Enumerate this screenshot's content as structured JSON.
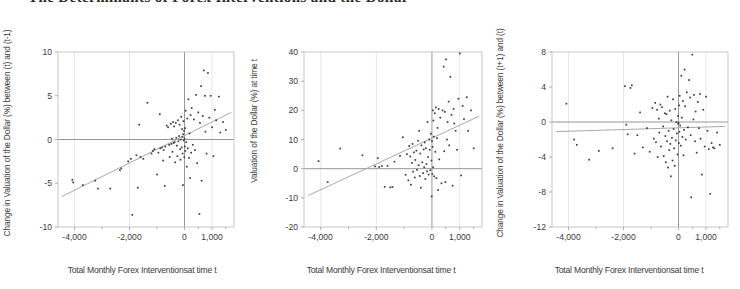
{
  "figure": {
    "title_clipped": "The Determinants of Forex Interventions and the Dollar",
    "background": "#ffffff",
    "point_color": "#3d3d3d",
    "trend_color": "#a8a8a8",
    "frame_color": "#b9b9b9"
  },
  "chart_data": [
    {
      "type": "scatter",
      "title": "",
      "xlabel": "Total Monthly Forex Interventionsat time t",
      "ylabel": "Change in Valuation of the Dollar (%) between (t) and (t-1)",
      "xlim": [
        -4600,
        1800
      ],
      "ylim": [
        -10,
        10
      ],
      "xticks": [
        -4000,
        -2000,
        0,
        1000
      ],
      "xticklabels": [
        "-4,000",
        "-2,000",
        "0",
        "1,000"
      ],
      "yticks": [
        -10,
        -5,
        0,
        5,
        10
      ],
      "yticklabels": [
        "-10",
        "-5",
        "0",
        "5",
        "10"
      ],
      "grid": true,
      "legend": "none",
      "trendline": {
        "x": [
          -4450,
          1700
        ],
        "y": [
          -6.5,
          3.1
        ]
      },
      "points": [
        [
          -4080,
          -4.6
        ],
        [
          -4050,
          -4.9
        ],
        [
          -3700,
          -5.2
        ],
        [
          -3250,
          -4.7
        ],
        [
          -3150,
          -5.6
        ],
        [
          -2700,
          -5.6
        ],
        [
          -2350,
          -3.5
        ],
        [
          -2300,
          -3.3
        ],
        [
          -2050,
          -2.5
        ],
        [
          -1950,
          -2.2
        ],
        [
          -1900,
          -8.6
        ],
        [
          -1750,
          -1.8
        ],
        [
          -1700,
          -5.5
        ],
        [
          -1650,
          1.7
        ],
        [
          -1600,
          -2.0
        ],
        [
          -1500,
          -2.2
        ],
        [
          -1350,
          4.2
        ],
        [
          -1200,
          -1.6
        ],
        [
          -1150,
          -1.3
        ],
        [
          -1100,
          -1.1
        ],
        [
          -1000,
          -4.0
        ],
        [
          -950,
          -1.5
        ],
        [
          -900,
          2.9
        ],
        [
          -880,
          -1.0
        ],
        [
          -820,
          -0.9
        ],
        [
          -780,
          -2.4
        ],
        [
          -760,
          -1.2
        ],
        [
          -720,
          -5.3
        ],
        [
          -700,
          -0.8
        ],
        [
          -650,
          1.6
        ],
        [
          -600,
          1.4
        ],
        [
          -560,
          -0.6
        ],
        [
          -540,
          -2.0
        ],
        [
          -500,
          1.8
        ],
        [
          -480,
          -0.5
        ],
        [
          -460,
          0.1
        ],
        [
          -440,
          -1.4
        ],
        [
          -420,
          2.0
        ],
        [
          -400,
          -0.4
        ],
        [
          -380,
          1.5
        ],
        [
          -360,
          -0.3
        ],
        [
          -340,
          -2.6
        ],
        [
          -320,
          1.9
        ],
        [
          -300,
          0.2
        ],
        [
          -280,
          -0.7
        ],
        [
          -260,
          -1.9
        ],
        [
          -240,
          2.2
        ],
        [
          -220,
          -0.2
        ],
        [
          -200,
          0.4
        ],
        [
          -180,
          1.7
        ],
        [
          -160,
          -1.1
        ],
        [
          -150,
          -2.3
        ],
        [
          -140,
          0.0
        ],
        [
          -120,
          2.6
        ],
        [
          -100,
          -0.9
        ],
        [
          -90,
          1.2
        ],
        [
          -80,
          0.3
        ],
        [
          -70,
          -1.6
        ],
        [
          -60,
          -5.2
        ],
        [
          -50,
          0.6
        ],
        [
          -40,
          2.1
        ],
        [
          -30,
          -0.1
        ],
        [
          -20,
          1.0
        ],
        [
          -10,
          -2.0
        ],
        [
          0,
          0.1
        ],
        [
          10,
          -0.8
        ],
        [
          20,
          1.3
        ],
        [
          30,
          -1.3
        ],
        [
          40,
          3.3
        ],
        [
          60,
          -0.3
        ],
        [
          80,
          -3.1
        ],
        [
          100,
          2.4
        ],
        [
          120,
          -1.0
        ],
        [
          140,
          4.6
        ],
        [
          160,
          -2.1
        ],
        [
          180,
          0.7
        ],
        [
          200,
          -4.4
        ],
        [
          220,
          2.8
        ],
        [
          240,
          -1.5
        ],
        [
          260,
          3.6
        ],
        [
          300,
          -0.6
        ],
        [
          340,
          2.3
        ],
        [
          380,
          -1.2
        ],
        [
          420,
          5.1
        ],
        [
          460,
          -2.7
        ],
        [
          500,
          3.1
        ],
        [
          540,
          -8.5
        ],
        [
          560,
          1.9
        ],
        [
          600,
          6.1
        ],
        [
          620,
          -4.7
        ],
        [
          660,
          2.7
        ],
        [
          700,
          7.9
        ],
        [
          740,
          5.0
        ],
        [
          760,
          0.9
        ],
        [
          800,
          -1.6
        ],
        [
          850,
          7.6
        ],
        [
          900,
          2.5
        ],
        [
          950,
          5.0
        ],
        [
          1000,
          1.4
        ],
        [
          1050,
          -1.9
        ],
        [
          1100,
          3.4
        ],
        [
          1150,
          2.2
        ],
        [
          1250,
          4.9
        ],
        [
          1300,
          0.8
        ],
        [
          1400,
          2.0
        ],
        [
          1500,
          1.1
        ]
      ]
    },
    {
      "type": "scatter",
      "title": "",
      "xlabel": "Total Monthly Forex Interventionsat time t",
      "ylabel": "Valuation of the Dollar (%) at time t",
      "xlim": [
        -4600,
        1800
      ],
      "ylim": [
        -20,
        40
      ],
      "xticks": [
        -4000,
        -2000,
        0,
        1000
      ],
      "xticklabels": [
        "-4,000",
        "-2,000",
        "0",
        "1,000"
      ],
      "yticks": [
        -20,
        -10,
        0,
        10,
        20,
        30,
        40
      ],
      "yticklabels": [
        "-20",
        "-10",
        "0",
        "10",
        "20",
        "30",
        "40"
      ],
      "grid": true,
      "legend": "none",
      "trendline": {
        "x": [
          -4450,
          1700
        ],
        "y": [
          -9.2,
          18.0
        ]
      },
      "points": [
        [
          -4080,
          2.6
        ],
        [
          -3750,
          -4.6
        ],
        [
          -3300,
          6.9
        ],
        [
          -2500,
          4.6
        ],
        [
          -2050,
          0.8
        ],
        [
          -1950,
          3.6
        ],
        [
          -1900,
          0.6
        ],
        [
          -1800,
          0.9
        ],
        [
          -1700,
          -6.2
        ],
        [
          -1600,
          1.0
        ],
        [
          -1500,
          -6.4
        ],
        [
          -1420,
          -6.3
        ],
        [
          -1350,
          2.4
        ],
        [
          -1150,
          4.4
        ],
        [
          -1050,
          10.8
        ],
        [
          -950,
          -2.1
        ],
        [
          -900,
          5.0
        ],
        [
          -850,
          -4.0
        ],
        [
          -820,
          7.8
        ],
        [
          -780,
          4.2
        ],
        [
          -760,
          -5.5
        ],
        [
          -720,
          2.0
        ],
        [
          -700,
          8.5
        ],
        [
          -680,
          -1.0
        ],
        [
          -650,
          5.6
        ],
        [
          -620,
          -3.0
        ],
        [
          -600,
          3.0
        ],
        [
          -560,
          6.2
        ],
        [
          -540,
          -0.4
        ],
        [
          -500,
          9.6
        ],
        [
          -480,
          1.2
        ],
        [
          -460,
          13.0
        ],
        [
          -440,
          -2.5
        ],
        [
          -420,
          5.2
        ],
        [
          -400,
          -6.5
        ],
        [
          -380,
          8.0
        ],
        [
          -350,
          2.2
        ],
        [
          -320,
          -1.5
        ],
        [
          -300,
          6.6
        ],
        [
          -280,
          0.5
        ],
        [
          -260,
          9.0
        ],
        [
          -240,
          -3.5
        ],
        [
          -220,
          7.0
        ],
        [
          -200,
          1.6
        ],
        [
          -180,
          -0.9
        ],
        [
          -160,
          16.0
        ],
        [
          -140,
          4.0
        ],
        [
          -120,
          -2.0
        ],
        [
          -100,
          10.0
        ],
        [
          -80,
          6.5
        ],
        [
          -60,
          -0.5
        ],
        [
          -40,
          12.0
        ],
        [
          -20,
          2.8
        ],
        [
          -10,
          -9.5
        ],
        [
          0,
          9.5
        ],
        [
          10,
          -1.8
        ],
        [
          20,
          7.5
        ],
        [
          30,
          20.0
        ],
        [
          40,
          0.5
        ],
        [
          50,
          16.5
        ],
        [
          60,
          11.0
        ],
        [
          80,
          -2.6
        ],
        [
          100,
          19.0
        ],
        [
          120,
          5.8
        ],
        [
          140,
          21.0
        ],
        [
          160,
          -3.2
        ],
        [
          180,
          10.5
        ],
        [
          200,
          14.0
        ],
        [
          220,
          -7.3
        ],
        [
          240,
          20.5
        ],
        [
          260,
          3.2
        ],
        [
          300,
          17.5
        ],
        [
          340,
          -5.0
        ],
        [
          380,
          20.0
        ],
        [
          420,
          35.0
        ],
        [
          440,
          6.0
        ],
        [
          460,
          19.5
        ],
        [
          480,
          -4.6
        ],
        [
          500,
          37.5
        ],
        [
          540,
          10.0
        ],
        [
          560,
          16.0
        ],
        [
          600,
          23.0
        ],
        [
          620,
          8.0
        ],
        [
          660,
          31.5
        ],
        [
          700,
          18.5
        ],
        [
          740,
          -5.8
        ],
        [
          780,
          20.5
        ],
        [
          800,
          15.5
        ],
        [
          850,
          13.0
        ],
        [
          900,
          6.5
        ],
        [
          950,
          24.0
        ],
        [
          1000,
          39.5
        ],
        [
          1050,
          -2.3
        ],
        [
          1100,
          21.5
        ],
        [
          1150,
          17.0
        ],
        [
          1250,
          24.5
        ],
        [
          1300,
          13.0
        ],
        [
          1400,
          20.0
        ],
        [
          1500,
          7.0
        ]
      ]
    },
    {
      "type": "scatter",
      "title": "",
      "xlabel": "Total Monthly Forex Interventionsat time t",
      "ylabel": "Change in Valuation of the Dollar (%) between (t+1) and (t)",
      "xlim": [
        -4600,
        1800
      ],
      "ylim": [
        -12,
        8
      ],
      "xticks": [
        -4000,
        -2000,
        0,
        1000
      ],
      "xticklabels": [
        "-4,000",
        "-2,000",
        "0",
        "1,000"
      ],
      "yticks": [
        -12,
        -8,
        -4,
        0,
        4,
        8
      ],
      "yticklabels": [
        "-12",
        "-8",
        "-4",
        "0",
        "4",
        "8"
      ],
      "grid": true,
      "legend": "none",
      "trendline": {
        "x": [
          -4450,
          1700
        ],
        "y": [
          -1.1,
          -0.5
        ]
      },
      "points": [
        [
          -4080,
          2.1
        ],
        [
          -3800,
          -2.0
        ],
        [
          -3700,
          -2.6
        ],
        [
          -3250,
          -4.3
        ],
        [
          -2900,
          -3.3
        ],
        [
          -2400,
          -3.0
        ],
        [
          -1950,
          4.1
        ],
        [
          -1900,
          -0.3
        ],
        [
          -1850,
          -1.4
        ],
        [
          -1750,
          3.9
        ],
        [
          -1700,
          4.2
        ],
        [
          -1600,
          -3.6
        ],
        [
          -1500,
          -1.5
        ],
        [
          -1400,
          1.1
        ],
        [
          -1300,
          -2.9
        ],
        [
          -1150,
          -0.7
        ],
        [
          -1050,
          -3.4
        ],
        [
          -950,
          1.6
        ],
        [
          -900,
          -1.9
        ],
        [
          -850,
          2.2
        ],
        [
          -820,
          -2.3
        ],
        [
          -780,
          1.4
        ],
        [
          -760,
          -4.0
        ],
        [
          -720,
          0.4
        ],
        [
          -700,
          -1.2
        ],
        [
          -660,
          2.0
        ],
        [
          -640,
          -2.8
        ],
        [
          -600,
          1.7
        ],
        [
          -560,
          -0.5
        ],
        [
          -540,
          -3.9
        ],
        [
          -500,
          1.0
        ],
        [
          -480,
          -1.6
        ],
        [
          -460,
          -4.6
        ],
        [
          -440,
          0.9
        ],
        [
          -420,
          -2.2
        ],
        [
          -400,
          2.9
        ],
        [
          -380,
          -5.2
        ],
        [
          -360,
          -1.0
        ],
        [
          -340,
          -3.2
        ],
        [
          -320,
          1.3
        ],
        [
          -300,
          -2.5
        ],
        [
          -280,
          -6.2
        ],
        [
          -260,
          0.2
        ],
        [
          -240,
          -1.8
        ],
        [
          -220,
          -4.4
        ],
        [
          -200,
          2.6
        ],
        [
          -180,
          -0.8
        ],
        [
          -160,
          -3.0
        ],
        [
          -140,
          -5.0
        ],
        [
          -120,
          1.5
        ],
        [
          -100,
          -2.1
        ],
        [
          -80,
          0.0
        ],
        [
          -60,
          -1.3
        ],
        [
          -40,
          -3.7
        ],
        [
          -20,
          0.7
        ],
        [
          -10,
          -0.2
        ],
        [
          0,
          -0.1
        ],
        [
          10,
          -2.4
        ],
        [
          20,
          1.9
        ],
        [
          30,
          -1.1
        ],
        [
          40,
          3.0
        ],
        [
          60,
          -0.4
        ],
        [
          80,
          -2.7
        ],
        [
          100,
          5.3
        ],
        [
          120,
          0.5
        ],
        [
          140,
          -1.7
        ],
        [
          160,
          2.4
        ],
        [
          180,
          -3.8
        ],
        [
          200,
          -0.9
        ],
        [
          220,
          6.0
        ],
        [
          240,
          1.8
        ],
        [
          260,
          -2.0
        ],
        [
          300,
          3.4
        ],
        [
          340,
          -0.6
        ],
        [
          380,
          4.8
        ],
        [
          420,
          2.8
        ],
        [
          440,
          -1.5
        ],
        [
          460,
          -8.6
        ],
        [
          500,
          7.7
        ],
        [
          540,
          0.3
        ],
        [
          560,
          3.1
        ],
        [
          600,
          -2.2
        ],
        [
          620,
          1.2
        ],
        [
          660,
          -3.5
        ],
        [
          700,
          2.3
        ],
        [
          740,
          -0.7
        ],
        [
          780,
          3.2
        ],
        [
          800,
          -1.9
        ],
        [
          850,
          -6.0
        ],
        [
          900,
          1.4
        ],
        [
          950,
          -2.8
        ],
        [
          1000,
          2.9
        ],
        [
          1050,
          -1.0
        ],
        [
          1100,
          -3.1
        ],
        [
          1150,
          -8.2
        ],
        [
          1200,
          -2.4
        ],
        [
          1250,
          -2.9
        ],
        [
          1300,
          -3.0
        ],
        [
          1400,
          -1.2
        ],
        [
          1500,
          -2.6
        ]
      ]
    }
  ]
}
